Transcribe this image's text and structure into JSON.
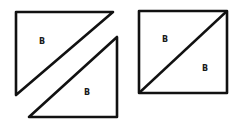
{
  "diagram": {
    "stroke_color": "#111111",
    "background": "#ffffff",
    "separated_pair": {
      "upper_triangle": {
        "label": "B",
        "points": "16,12 113,12 16,95"
      },
      "lower_triangle": {
        "label": "B",
        "points": "117,37 117,117 29,117"
      }
    },
    "assembled_square": {
      "rect": {
        "x": 139,
        "y": 11,
        "w": 88,
        "h": 82
      },
      "diagonal": {
        "x1": 139,
        "y1": 93,
        "x2": 227,
        "y2": 11
      },
      "labels": [
        "B",
        "B"
      ]
    }
  }
}
